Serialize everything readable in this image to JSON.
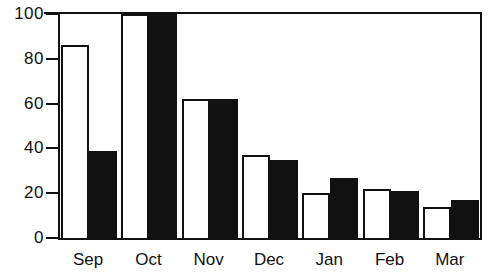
{
  "chart_data": {
    "type": "bar",
    "title": "",
    "subtitle": "",
    "xlabel": "",
    "ylabel": "",
    "categories": [
      "Sep",
      "Oct",
      "Nov",
      "Dec",
      "Jan",
      "Feb",
      "Mar"
    ],
    "series": [
      {
        "name": "open",
        "style": "white-bar-black-outline",
        "values": [
          86,
          100,
          62,
          37,
          20,
          22,
          14
        ]
      },
      {
        "name": "filled",
        "style": "solid-black-bar",
        "values": [
          39,
          100,
          62,
          35,
          27,
          21,
          17
        ]
      }
    ],
    "ylim": [
      0,
      100
    ],
    "yticks": [
      0,
      20,
      40,
      60,
      80,
      100
    ],
    "ytick_labels": [
      "0",
      "20",
      "40",
      "60",
      "80",
      "100"
    ],
    "xtick_labels": [
      "Sep",
      "Oct",
      "Nov",
      "Dec",
      "Jan",
      "Feb",
      "Mar"
    ],
    "grid": false,
    "legend": null,
    "legend_position": "none",
    "annotations": [],
    "colors": {
      "open_bar_fill": "#ffffff",
      "open_bar_outline": "#111111",
      "filled_bar": "#111111",
      "axis": "#111111",
      "background": "#ffffff",
      "text": "#111111"
    }
  }
}
